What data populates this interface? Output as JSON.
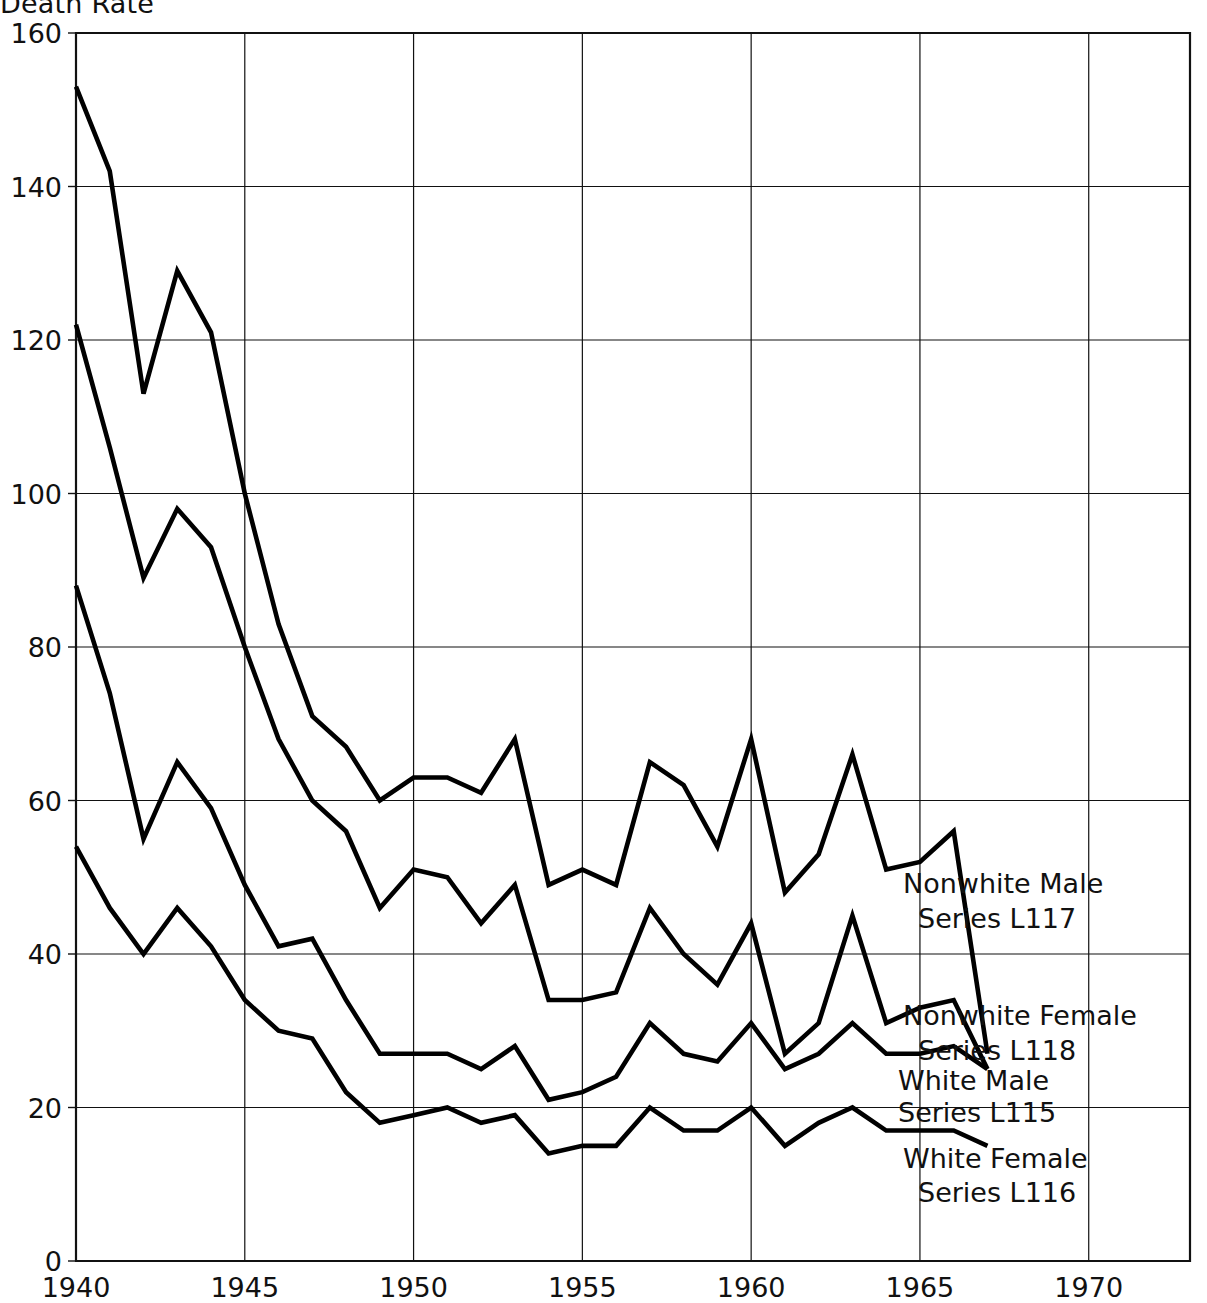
{
  "chart_data": {
    "type": "line",
    "title": "Death Rate",
    "xlabel": "",
    "ylabel": "Death Rate",
    "xlim": [
      1940,
      1973
    ],
    "ylim": [
      0,
      160
    ],
    "xticks": [
      1940,
      1945,
      1950,
      1955,
      1960,
      1965,
      1970
    ],
    "yticks": [
      0,
      20,
      40,
      60,
      80,
      100,
      120,
      140,
      160
    ],
    "grid": true,
    "legend_position": "right-inline",
    "x": [
      1940,
      1941,
      1942,
      1943,
      1944,
      1945,
      1946,
      1947,
      1948,
      1949,
      1950,
      1951,
      1952,
      1953,
      1954,
      1955,
      1956,
      1957,
      1958,
      1959,
      1960,
      1961,
      1962,
      1963,
      1964,
      1965,
      1966,
      1967
    ],
    "series": [
      {
        "name": "Nonwhite Male",
        "label": "Nonwhite Male",
        "series_code": "Series L117",
        "color": "#000000",
        "values": [
          153,
          142,
          113,
          129,
          121,
          100,
          83,
          71,
          67,
          60,
          63,
          63,
          61,
          68,
          49,
          51,
          49,
          65,
          62,
          54,
          68,
          48,
          53,
          66,
          51,
          52,
          56,
          27
        ]
      },
      {
        "name": "Nonwhite Female",
        "label": "Nonwhite Female",
        "series_code": "Series L118",
        "color": "#000000",
        "values": [
          122,
          106,
          89,
          98,
          93,
          80,
          68,
          60,
          56,
          46,
          51,
          50,
          44,
          49,
          34,
          34,
          35,
          46,
          40,
          36,
          44,
          27,
          31,
          45,
          31,
          33,
          34,
          25
        ]
      },
      {
        "name": "White Male",
        "label": "White Male",
        "series_code": "Series L115",
        "color": "#000000",
        "values": [
          88,
          74,
          55,
          65,
          59,
          49,
          41,
          42,
          34,
          27,
          27,
          27,
          25,
          28,
          21,
          22,
          24,
          31,
          27,
          26,
          31,
          25,
          27,
          31,
          27,
          27,
          28,
          25
        ]
      },
      {
        "name": "White Female",
        "label": "White Female",
        "series_code": "Series L116",
        "color": "#000000",
        "values": [
          54,
          46,
          40,
          46,
          41,
          34,
          30,
          29,
          22,
          18,
          19,
          20,
          18,
          19,
          14,
          15,
          15,
          20,
          17,
          17,
          20,
          15,
          18,
          20,
          17,
          17,
          17,
          15
        ]
      }
    ],
    "annotations": [
      {
        "id": "nonwhite-male-label",
        "line1": "Nonwhite Male",
        "line2": "Series L117"
      },
      {
        "id": "nonwhite-female-label",
        "line1": "Nonwhite Female",
        "line2": "Series L118"
      },
      {
        "id": "white-male-label",
        "line1": "White Male",
        "line2": "Series L115"
      },
      {
        "id": "white-female-label",
        "line1": "White Female",
        "line2": "Series L116"
      }
    ]
  },
  "axis": {
    "y_labels": [
      "160",
      "140",
      "120",
      "100",
      "80",
      "60",
      "40",
      "20",
      "0"
    ],
    "x_labels": [
      "1940",
      "1945",
      "1950",
      "1955",
      "1960",
      "1965",
      "1970"
    ]
  },
  "header": {
    "title": "Death Rate"
  }
}
